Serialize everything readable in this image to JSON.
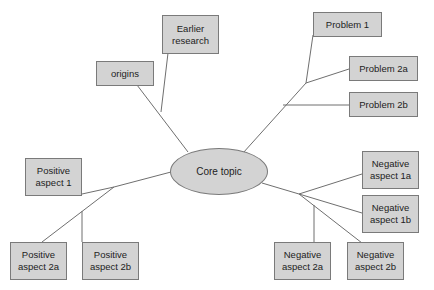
{
  "diagram": {
    "type": "mind-map",
    "colors": {
      "node_fill": "#d3d3d3",
      "node_border": "#7a7a7a",
      "line": "#6f6f6f",
      "text": "#222222",
      "background": "#ffffff"
    },
    "core": {
      "label": "Core topic"
    },
    "nodes": {
      "origins": {
        "label": "origins"
      },
      "earlier_research": {
        "label": "Earlier\nresearch"
      },
      "problem_1": {
        "label": "Problem 1"
      },
      "problem_2a": {
        "label": "Problem 2a"
      },
      "problem_2b": {
        "label": "Problem 2b"
      },
      "positive_1": {
        "label": "Positive\naspect 1"
      },
      "positive_2a": {
        "label": "Positive\naspect 2a"
      },
      "positive_2b": {
        "label": "Positive\naspect 2b"
      },
      "negative_1a": {
        "label": "Negative\naspect 1a"
      },
      "negative_1b": {
        "label": "Negative\naspect 1b"
      },
      "negative_2a": {
        "label": "Negative\naspect 2a"
      },
      "negative_2b": {
        "label": "Negative\naspect 2b"
      }
    },
    "edges": [
      [
        "Core topic",
        "origins"
      ],
      [
        "Core topic",
        "Earlier research"
      ],
      [
        "Core topic",
        "Problem 1"
      ],
      [
        "Core topic",
        "Problem 2a"
      ],
      [
        "Core topic",
        "Problem 2b"
      ],
      [
        "Core topic",
        "Positive aspect 1"
      ],
      [
        "Core topic",
        "Positive aspect 2a"
      ],
      [
        "Core topic",
        "Positive aspect 2b"
      ],
      [
        "Core topic",
        "Negative aspect 1a"
      ],
      [
        "Core topic",
        "Negative aspect 1b"
      ],
      [
        "Core topic",
        "Negative aspect 2a"
      ],
      [
        "Core topic",
        "Negative aspect 2b"
      ]
    ]
  }
}
